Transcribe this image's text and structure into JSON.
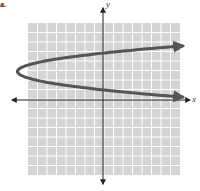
{
  "chart_data": {
    "type": "line",
    "title": "",
    "problem_marker": "a.",
    "xlabel": "x",
    "ylabel": "y",
    "grid": true,
    "grid_cells": 16,
    "xlim": [
      -9,
      8
    ],
    "ylim": [
      -8,
      8
    ],
    "series": [
      {
        "name": "parabola opening right",
        "equation_estimate": "x = 2.4(y - 3)^2 - 9",
        "vertex": [
          -9,
          3
        ],
        "y_intercepts": [
          0.7,
          4.6
        ],
        "points": [
          [
            8,
            5.7
          ],
          [
            0,
            4.6
          ],
          [
            -9,
            3
          ],
          [
            0,
            0.7
          ],
          [
            8,
            -0.1
          ]
        ]
      }
    ]
  },
  "colors": {
    "grid_bg": "#d4d4d4",
    "grid_line": "#ffffff",
    "axis": "#222222",
    "curve": "#555555"
  },
  "labels": {
    "x_axis": "x",
    "y_axis": "y",
    "marker": "a."
  }
}
